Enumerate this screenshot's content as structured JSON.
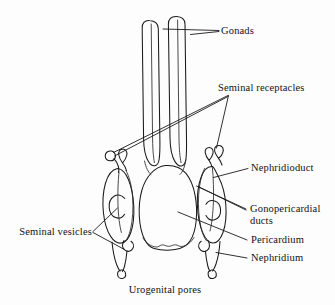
{
  "figure": {
    "background_color": "#fdfdfd",
    "stroke_color": "#1a1a1a",
    "width": 335,
    "height": 305
  },
  "labels": {
    "gonads": "Gonads",
    "seminal_receptacles": "Seminal receptacles",
    "nephridioduct": "Nephridioduct",
    "gonopericardial_ducts_line1": "Gonopericardial",
    "gonopericardial_ducts_line2": "ducts",
    "pericardium": "Pericardium",
    "nephridium": "Nephridium",
    "seminal_vesicles": "Seminal vesicles",
    "urogenital_pores": "Urogenital pores"
  },
  "structures": [
    {
      "name": "gonad-left",
      "label": "Gonads"
    },
    {
      "name": "gonad-right",
      "label": "Gonads"
    },
    {
      "name": "seminal-receptacle-left",
      "label": "Seminal receptacles"
    },
    {
      "name": "seminal-receptacle-right",
      "label": "Seminal receptacles"
    },
    {
      "name": "nephridium-left",
      "label": "Nephridium"
    },
    {
      "name": "nephridium-right",
      "label": "Nephridium"
    },
    {
      "name": "seminal-vesicle-left",
      "label": "Seminal vesicles"
    },
    {
      "name": "seminal-vesicle-right",
      "label": "Seminal vesicles"
    },
    {
      "name": "pericardium",
      "label": "Pericardium"
    },
    {
      "name": "nephridioduct",
      "label": "Nephridioduct"
    },
    {
      "name": "gonopericardial-duct-left",
      "label": "Gonopericardial ducts"
    },
    {
      "name": "gonopericardial-duct-right",
      "label": "Gonopericardial ducts"
    },
    {
      "name": "urogenital-pore-left",
      "label": "Urogenital pores"
    },
    {
      "name": "urogenital-pore-right",
      "label": "Urogenital pores"
    }
  ]
}
